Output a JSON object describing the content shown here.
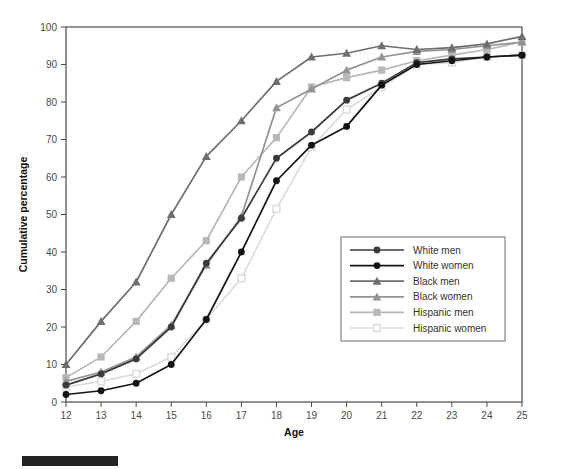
{
  "chart_data": {
    "type": "line",
    "title": "",
    "xlabel": "Age",
    "ylabel": "Cumulative percentage",
    "x": [
      12,
      13,
      14,
      15,
      16,
      17,
      18,
      19,
      20,
      21,
      22,
      23,
      24,
      25
    ],
    "xlim": [
      12,
      25
    ],
    "ylim": [
      0,
      100
    ],
    "xticks": [
      "12",
      "13",
      "14",
      "15",
      "16",
      "17",
      "18",
      "19",
      "20",
      "21",
      "22",
      "23",
      "24",
      "25"
    ],
    "yticks": [
      "0",
      "10",
      "20",
      "30",
      "40",
      "50",
      "60",
      "70",
      "80",
      "90",
      "100"
    ],
    "grid": false,
    "legend_position": "lower right",
    "series": [
      {
        "name": "White men",
        "color": "#3b3b3b",
        "marker": "filled-circle",
        "values": [
          4.5,
          7.5,
          11.5,
          20.0,
          37.0,
          49.0,
          65.0,
          72.0,
          80.5,
          85.0,
          90.5,
          91.5,
          92.0,
          92.5
        ]
      },
      {
        "name": "White women",
        "color": "#141414",
        "marker": "filled-circle",
        "values": [
          2.0,
          3.0,
          5.0,
          10.0,
          22.0,
          40.0,
          59.0,
          68.5,
          73.5,
          84.5,
          90.0,
          91.0,
          92.0,
          92.5
        ]
      },
      {
        "name": "Black men",
        "color": "#6e6e6e",
        "marker": "filled-triangle",
        "values": [
          10.0,
          21.5,
          32.0,
          50.0,
          65.5,
          75.0,
          85.5,
          92.0,
          93.0,
          95.0,
          94.0,
          94.5,
          95.5,
          97.5
        ]
      },
      {
        "name": "Black women",
        "color": "#939393",
        "marker": "filled-triangle",
        "values": [
          5.5,
          8.0,
          12.0,
          20.5,
          36.5,
          49.5,
          78.5,
          83.5,
          88.5,
          92.0,
          93.5,
          94.0,
          95.0,
          96.0
        ]
      },
      {
        "name": "Hispanic men",
        "color": "#b8b8b8",
        "marker": "filled-square",
        "values": [
          6.5,
          12.0,
          21.5,
          33.0,
          43.0,
          60.0,
          70.5,
          84.0,
          86.5,
          88.5,
          91.0,
          92.5,
          94.0,
          96.0
        ]
      },
      {
        "name": "Hispanic women",
        "color": "#dcdcdc",
        "marker": "open-square",
        "values": [
          4.0,
          5.5,
          7.5,
          12.0,
          22.0,
          33.0,
          51.5,
          68.0,
          78.0,
          84.0,
          90.0,
          90.5,
          92.0,
          92.5
        ]
      }
    ]
  },
  "axes": {
    "x_title": "Age",
    "y_title": "Cumulative percentage"
  }
}
